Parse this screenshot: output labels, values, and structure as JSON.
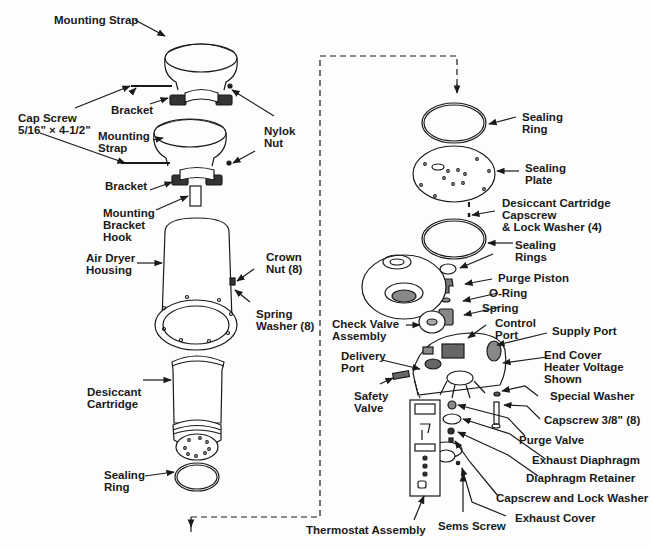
{
  "diagram": {
    "type": "exploded-parts-view",
    "colors": {
      "ink": "#1a1a1a",
      "background": "#fdfdfd"
    },
    "labels": {
      "mounting_strap_top": "Mounting Strap",
      "cap_screw": "Cap Screw\n5/16\" × 4-1/2\"",
      "bracket_top": "Bracket",
      "nylok_nut": "Nylok\nNut",
      "mounting_strap_lower": "Mounting\nStrap",
      "bracket_lower": "Bracket",
      "mounting_bracket_hook": "Mounting\nBracket\nHook",
      "air_dryer_housing": "Air Dryer\nHousing",
      "crown_nut": "Crown\nNut (8)",
      "spring_washer": "Spring\nWasher (8)",
      "desiccant_cartridge": "Desiccant\nCartridge",
      "sealing_ring_bottom": "Sealing\nRing",
      "thermostat_assembly": "Thermostat Assembly",
      "sealing_ring_top": "Sealing\nRing",
      "sealing_plate": "Sealing\nPlate",
      "desiccant_capscrew": "Desiccant Cartridge\nCapscrew\n& Lock Washer (4)",
      "sealing_rings": "Sealing\nRings",
      "purge_piston": "Purge Piston",
      "o_ring": "O-Ring",
      "spring": "Spring",
      "check_valve_assembly": "Check Valve\nAssembly",
      "control_port": "Control\nPort",
      "supply_port": "Supply Port",
      "end_cover": "End Cover\nHeater Voltage\nShown",
      "delivery_port": "Delivery\nPort",
      "safety_valve": "Safety\nValve",
      "special_washer": "Special Washer",
      "capscrew_38": "Capscrew 3/8\" (8)",
      "purge_valve": "Purge Valve",
      "exhaust_diaphragm": "Exhaust Diaphragm",
      "diaphragm_retainer": "Diaphragm Retainer",
      "capscrew_lock_washer": "Capscrew and Lock Washer",
      "exhaust_cover": "Exhaust Cover",
      "sems_screw": "Sems Screw"
    }
  }
}
